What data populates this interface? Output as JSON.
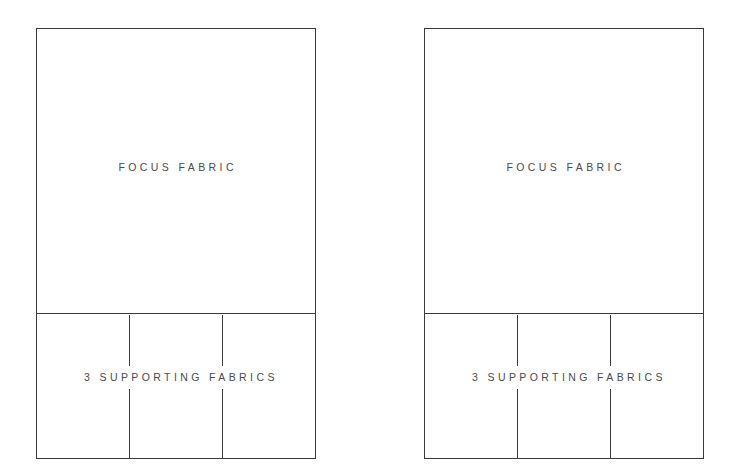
{
  "diagram": {
    "background_color": "#ffffff",
    "line_color": "#3a3a3e",
    "text_color": "#4a4a52",
    "panels": [
      {
        "id": "left",
        "focus_label": "FOCUS FABRIC",
        "support_label": "3 SUPPORTING FABRICS",
        "support_column_count": 3
      },
      {
        "id": "right",
        "focus_label": "FOCUS FABRIC",
        "support_label": "3 SUPPORTING FABRICS",
        "support_column_count": 3
      }
    ]
  }
}
